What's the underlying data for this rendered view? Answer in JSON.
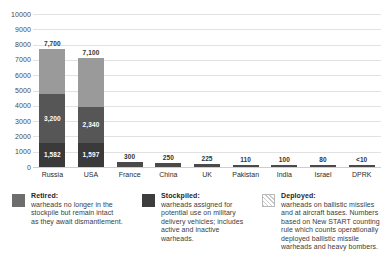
{
  "chart_data": {
    "type": "bar",
    "subtype": "stacked-bar",
    "title": "",
    "subtitle": "",
    "xlabel": "",
    "ylabel": "",
    "ylim": [
      0,
      10000
    ],
    "grid": true,
    "legend_position": "bottom",
    "y_ticks": [
      "10000",
      "9000",
      "8000",
      "7000",
      "6000",
      "5000",
      "4000",
      "3000",
      "2000",
      "1000",
      "0"
    ],
    "y_tick_values": [
      10000,
      9000,
      8000,
      7000,
      6000,
      5000,
      4000,
      3000,
      2000,
      1000,
      0
    ],
    "categories": [
      "Russia",
      "USA",
      "France",
      "China",
      "UK",
      "Pakistan",
      "India",
      "Israel",
      "DPRK"
    ],
    "series": [
      {
        "name": "Deployed",
        "values": [
          1582,
          1597,
          null,
          null,
          null,
          null,
          null,
          null,
          null
        ],
        "labels": [
          "1,582",
          "1,597",
          "",
          "",
          "",
          "",
          "",
          "",
          ""
        ]
      },
      {
        "name": "Stockpiled",
        "values": [
          3200,
          2340,
          null,
          null,
          null,
          null,
          null,
          null,
          null
        ],
        "labels": [
          "3,200",
          "2,340",
          "",
          "",
          "",
          "",
          "",
          "",
          ""
        ]
      },
      {
        "name": "Retired",
        "values": [
          2918,
          3163,
          null,
          null,
          null,
          null,
          null,
          null,
          null
        ],
        "labels": [
          "",
          "",
          "",
          "",
          "",
          "",
          "",
          "",
          ""
        ]
      }
    ],
    "totals": [
      7700,
      7100,
      300,
      250,
      225,
      110,
      100,
      80,
      10
    ],
    "total_labels": [
      "7,700",
      "7,100",
      "300",
      "250",
      "225",
      "110",
      "100",
      "80",
      "<10"
    ]
  },
  "bars": [
    {
      "name": "Russia",
      "total_label": "7,700",
      "total": 7700,
      "segments": [
        {
          "kind": "retired",
          "value": 2918,
          "label": ""
        },
        {
          "kind": "stockpiled",
          "value": 3200,
          "label": "3,200"
        },
        {
          "kind": "deployed",
          "value": 1582,
          "label": "1,582"
        }
      ]
    },
    {
      "name": "USA",
      "total_label": "7,100",
      "total": 7100,
      "segments": [
        {
          "kind": "retired",
          "value": 3163,
          "label": ""
        },
        {
          "kind": "stockpiled",
          "value": 2340,
          "label": "2,340"
        },
        {
          "kind": "deployed",
          "value": 1597,
          "label": "1,597"
        }
      ]
    },
    {
      "name": "France",
      "total_label": "300",
      "total": 300,
      "segments": [
        {
          "kind": "solid",
          "value": 300,
          "label": ""
        }
      ]
    },
    {
      "name": "China",
      "total_label": "250",
      "total": 250,
      "segments": [
        {
          "kind": "solid",
          "value": 250,
          "label": ""
        }
      ]
    },
    {
      "name": "UK",
      "total_label": "225",
      "total": 225,
      "segments": [
        {
          "kind": "solid",
          "value": 225,
          "label": ""
        }
      ]
    },
    {
      "name": "Pakistan",
      "total_label": "110",
      "total": 110,
      "segments": [
        {
          "kind": "solid",
          "value": 110,
          "label": ""
        }
      ]
    },
    {
      "name": "India",
      "total_label": "100",
      "total": 100,
      "segments": [
        {
          "kind": "solid",
          "value": 100,
          "label": ""
        }
      ]
    },
    {
      "name": "Israel",
      "total_label": "80",
      "total": 80,
      "segments": [
        {
          "kind": "solid",
          "value": 80,
          "label": ""
        }
      ]
    },
    {
      "name": "DPRK",
      "total_label": "<10",
      "total": 10,
      "segments": [
        {
          "kind": "solid",
          "value": 10,
          "label": ""
        }
      ]
    }
  ],
  "legend": {
    "items": [
      {
        "swatch": "retired-swatch",
        "title": "Retired:",
        "lines": [
          "warheads no longer in the",
          "stockpile but remain intact",
          "as they await dismantlement."
        ]
      },
      {
        "swatch": "stockpiled-swatch",
        "title": "Stockpiled:",
        "lines": [
          "warheads assigned for",
          "potential use on military",
          "delivery vehicles; includes",
          "active and inactive",
          "warheads."
        ]
      },
      {
        "swatch": "deployed-swatch",
        "title": "Deployed:",
        "lines": [
          "warheads on ballistic missiles",
          "and at aircraft bases. Numbers",
          "based on New START counting",
          "rule which counts operationally",
          "deployed ballistic missile",
          "warheads and heavy bombers."
        ]
      }
    ]
  },
  "colors": {
    "retired": "#9a9a9a",
    "stockpiled": "#565656",
    "deployed": "#3a3a3a",
    "grid": "#e2e2e2",
    "text": "#2b2b2b"
  }
}
